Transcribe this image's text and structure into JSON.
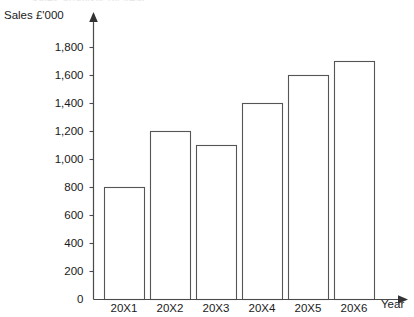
{
  "clipped_caption": "Sales analysis by year",
  "chart_data": {
    "type": "bar",
    "title": "",
    "categories": [
      "20X1",
      "20X2",
      "20X3",
      "20X4",
      "20X5",
      "20X6"
    ],
    "values": [
      800,
      1200,
      1100,
      1400,
      1600,
      1700
    ],
    "series": [
      {
        "name": "Sales",
        "values": [
          800,
          1200,
          1100,
          1400,
          1600,
          1700
        ]
      }
    ],
    "xlabel": "Year",
    "ylabel": "Sales  £'000",
    "ylim": [
      0,
      1800
    ],
    "ytick_step": 200,
    "ytick_labels": [
      "0",
      "200",
      "400",
      "600",
      "800",
      "1,000",
      "1,200",
      "1,400",
      "1,600",
      "1,800"
    ],
    "ytick_values": [
      0,
      200,
      400,
      600,
      800,
      1000,
      1200,
      1400,
      1600,
      1800
    ],
    "grid": false,
    "legend": false,
    "bar_fill": "#ffffff",
    "bar_stroke": "#555555",
    "axis_color": "#4a4a4a"
  }
}
